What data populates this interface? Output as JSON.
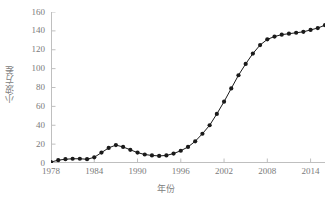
{
  "chart_data": {
    "type": "line",
    "title": "",
    "xlabel": "年份",
    "ylabel": "小波方差",
    "xlim": [
      1978,
      2016
    ],
    "ylim": [
      0,
      160
    ],
    "ytick_values": [
      0,
      20,
      40,
      60,
      80,
      100,
      120,
      140,
      160
    ],
    "ytick_labels": [
      "0",
      "20",
      "40",
      "60",
      "80",
      "100",
      "120",
      "140",
      "160"
    ],
    "xtick_values": [
      1978,
      1984,
      1990,
      1996,
      2002,
      2008,
      2014
    ],
    "xtick_labels": [
      "1978",
      "1984",
      "1990",
      "1996",
      "2002",
      "2008",
      "2014"
    ],
    "grid": false,
    "legend": false,
    "marker": "circle",
    "marker_color": "#1a1a1a",
    "line_color": "#1a1a1a",
    "axis_color": "#bfbfbf",
    "text_color": "#7a7a7a",
    "x": [
      1978,
      1979,
      1980,
      1981,
      1982,
      1983,
      1984,
      1985,
      1986,
      1987,
      1988,
      1989,
      1990,
      1991,
      1992,
      1993,
      1994,
      1995,
      1996,
      1997,
      1998,
      1999,
      2000,
      2001,
      2002,
      2003,
      2004,
      2005,
      2006,
      2007,
      2008,
      2009,
      2010,
      2011,
      2012,
      2013,
      2014,
      2015,
      2016
    ],
    "values": [
      1,
      3,
      4,
      4.5,
      4.5,
      4,
      6,
      11,
      16,
      19,
      17,
      14,
      11,
      9,
      8,
      7.5,
      8,
      10,
      13,
      17,
      23,
      31,
      40,
      52,
      65,
      79,
      93,
      105,
      116,
      125,
      131,
      134,
      136,
      137,
      138,
      139,
      141,
      143,
      146
    ],
    "series": [
      {
        "name": "小波方差",
        "values": [
          1,
          3,
          4,
          4.5,
          4.5,
          4,
          6,
          11,
          16,
          19,
          17,
          14,
          11,
          9,
          8,
          7.5,
          8,
          10,
          13,
          17,
          23,
          31,
          40,
          52,
          65,
          79,
          93,
          105,
          116,
          125,
          131,
          134,
          136,
          137,
          138,
          139,
          141,
          143,
          146
        ]
      }
    ]
  }
}
